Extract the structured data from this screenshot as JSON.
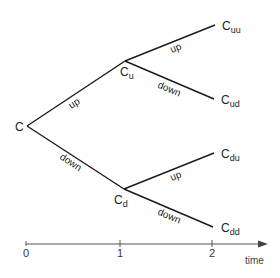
{
  "diagram": {
    "type": "binomial-tree",
    "root": {
      "label_base": "C",
      "label_sub": ""
    },
    "nodes": {
      "u": {
        "label_base": "C",
        "label_sub": "u"
      },
      "d": {
        "label_base": "C",
        "label_sub": "d"
      },
      "uu": {
        "label_base": "C",
        "label_sub": "uu"
      },
      "ud": {
        "label_base": "C",
        "label_sub": "ud"
      },
      "du": {
        "label_base": "C",
        "label_sub": "du"
      },
      "dd": {
        "label_base": "C",
        "label_sub": "dd"
      }
    },
    "edges": {
      "root_u": {
        "label": "up"
      },
      "root_d": {
        "label": "down"
      },
      "u_uu": {
        "label": "up"
      },
      "u_ud": {
        "label": "down"
      },
      "d_du": {
        "label": "up"
      },
      "d_dd": {
        "label": "down"
      }
    },
    "axis": {
      "title": "time",
      "ticks": [
        "0",
        "1",
        "2"
      ]
    }
  }
}
